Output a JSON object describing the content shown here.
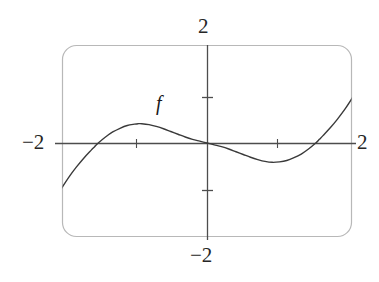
{
  "figure": {
    "name": "graph-of-f",
    "caption_label": "f"
  },
  "labels": {
    "top": "2",
    "left": "−2",
    "right": "2",
    "bottom": "−2",
    "function": "f"
  },
  "colors": {
    "frame": "#b8b8b8",
    "axis": "#4d4d4d",
    "curve": "#3a3a3a",
    "text": "#1a1a1a",
    "background": "#ffffff"
  },
  "chart_data": {
    "type": "line",
    "title": "",
    "xlabel": "",
    "ylabel": "",
    "xlim": [
      -2,
      2
    ],
    "ylim": [
      -2,
      2
    ],
    "grid": false,
    "legend": null,
    "annotations": [
      {
        "text": "f",
        "x": -0.96,
        "y": 0.85,
        "note": "curve name placed above the local maximum"
      }
    ],
    "axis_labels": {
      "x_left": "−2",
      "x_right": "2",
      "y_top": "2",
      "y_bottom": "−2"
    },
    "x_ticks": [
      -2,
      2
    ],
    "y_ticks": [
      -2,
      -1,
      1,
      2
    ],
    "tick_marks_drawn": {
      "y_axis": [
        1,
        -1
      ],
      "x_axis": [
        -1.55,
        1.55
      ]
    },
    "features": {
      "x_intercepts": [
        -1.55,
        0,
        1.55
      ],
      "local_maximum": {
        "x": -0.95,
        "y": 0.42
      },
      "local_minimum": {
        "x": 0.9,
        "y": -0.42
      },
      "inflection_point": {
        "x": 0,
        "y": 0
      },
      "enters_frame_bottom_at_x": -2.4,
      "exits_frame_top_at_x": 2.37,
      "shape": "cubic-like increasing-decreasing-increasing"
    },
    "series": [
      {
        "name": "f",
        "x": [
          -2.4,
          -2.3,
          -2.2,
          -2.1,
          -2.0,
          -1.9,
          -1.8,
          -1.7,
          -1.6,
          -1.55,
          -1.5,
          -1.4,
          -1.3,
          -1.2,
          -1.1,
          -1.0,
          -0.95,
          -0.9,
          -0.8,
          -0.7,
          -0.6,
          -0.5,
          -0.4,
          -0.3,
          -0.2,
          -0.1,
          0.0,
          0.1,
          0.2,
          0.3,
          0.4,
          0.5,
          0.6,
          0.7,
          0.8,
          0.9,
          1.0,
          1.1,
          1.2,
          1.3,
          1.4,
          1.5,
          1.55,
          1.6,
          1.7,
          1.8,
          1.9,
          2.0,
          2.1,
          2.2,
          2.3,
          2.37
        ],
        "y": [
          -2.15,
          -1.82,
          -1.52,
          -1.23,
          -0.97,
          -0.73,
          -0.52,
          -0.33,
          -0.16,
          -0.08,
          0.0,
          0.13,
          0.24,
          0.32,
          0.38,
          0.41,
          0.42,
          0.42,
          0.4,
          0.36,
          0.31,
          0.25,
          0.19,
          0.13,
          0.08,
          0.04,
          0.0,
          -0.04,
          -0.08,
          -0.13,
          -0.19,
          -0.25,
          -0.31,
          -0.36,
          -0.4,
          -0.42,
          -0.41,
          -0.38,
          -0.32,
          -0.24,
          -0.13,
          0.0,
          0.08,
          0.16,
          0.33,
          0.52,
          0.73,
          0.97,
          1.23,
          1.52,
          1.82,
          2.05
        ]
      }
    ]
  },
  "geometry": {
    "frame": {
      "x": 62,
      "y": 45,
      "width": 290,
      "height": 192,
      "corner_radius": 14
    },
    "x_axis_y": 143,
    "y_axis_x": 207,
    "unit_px_x": 72.5,
    "unit_px_y": 46
  }
}
